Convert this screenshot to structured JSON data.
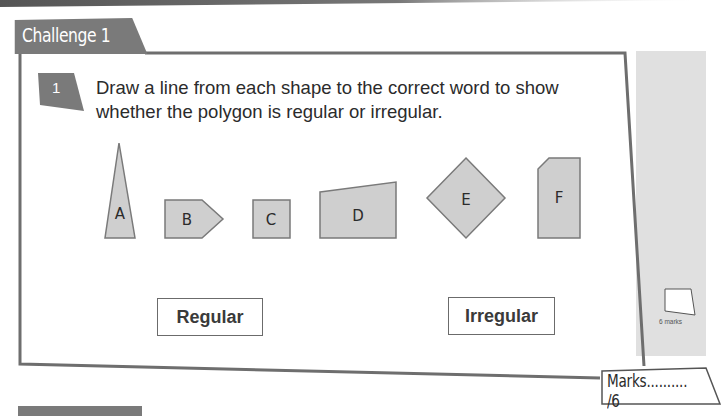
{
  "section": {
    "title": "Challenge 1"
  },
  "question": {
    "number": "1",
    "text": "Draw a line from each shape to the correct word to show whether the polygon is regular or irregular."
  },
  "shapes": [
    {
      "label": "A",
      "type": "isosceles-triangle"
    },
    {
      "label": "B",
      "type": "pentagon-arrow"
    },
    {
      "label": "C",
      "type": "square"
    },
    {
      "label": "D",
      "type": "trapezium"
    },
    {
      "label": "E",
      "type": "rotated-square"
    },
    {
      "label": "F",
      "type": "pentagon-cut-corner"
    }
  ],
  "answers": {
    "regular": "Regular",
    "irregular": "Irregular"
  },
  "sidebar": {
    "marks_available": "6 marks"
  },
  "marks": {
    "label": "Marks.......... /6"
  },
  "colors": {
    "tab_fill": "#7a7a7a",
    "frame_stroke": "#6e6e6e",
    "shape_fill": "#cfcfcf",
    "shape_stroke": "#7a7a7a",
    "side_panel": "#e0e0e0"
  }
}
